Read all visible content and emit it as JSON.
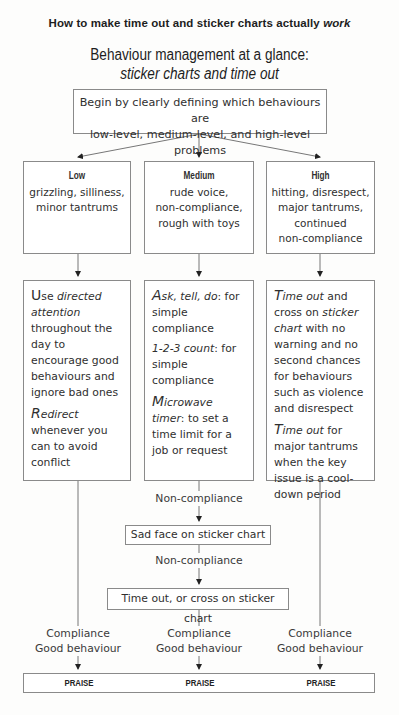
{
  "header": {
    "title": "How to make time out and sticker charts actually",
    "title_emph": "work"
  },
  "diagram": {
    "title_line1": "Behaviour management at a glance:",
    "title_line2": "sticker charts and time out",
    "start_box": {
      "line1": "Begin by clearly defining which behaviours are",
      "line2": "low-level, medium-level, and high-level problems"
    },
    "levels": [
      {
        "heading": "Low",
        "lines": [
          "grizzling, silliness,",
          "minor tantrums"
        ]
      },
      {
        "heading": "Medium",
        "lines": [
          "rude voice,",
          "non-compliance,",
          "rough with toys"
        ]
      },
      {
        "heading": "High",
        "lines": [
          "hitting, disrespect,",
          "major tantrums,",
          "continued",
          "non-compliance"
        ]
      }
    ],
    "strategies": {
      "low": {
        "p1_cap": "U",
        "p1_rest": "se ",
        "p1_em": "directed attention",
        "p1_tail": " throughout the day to encourage good behaviours and ignore bad ones",
        "p2_cap": "R",
        "p2_em": "edirect",
        "p2_tail": " whenever you can to avoid conflict"
      },
      "medium": {
        "p1_cap": "A",
        "p1_em": "sk, tell, do",
        "p1_tail": ": for simple compliance",
        "p2_em": "1-2-3 count",
        "p2_tail": ": for simple compliance",
        "p3_cap": "M",
        "p3_em": "icrowave timer",
        "p3_tail": ": to set a time limit for a job or request"
      },
      "high": {
        "p1_cap": "T",
        "p1_em": "ime out",
        "p1_mid": " and cross on ",
        "p1_em2": "sticker chart",
        "p1_tail": " with no warning and no second chances for behaviours such as violence and disrespect",
        "p2_cap": "T",
        "p2_em": "ime out",
        "p2_tail": " for major tantrums when the key issue is a cool-down period"
      }
    },
    "flow": {
      "noncompliance_1": "Non-compliance",
      "sad_face_box": "Sad face on sticker chart",
      "noncompliance_2": "Non-compliance",
      "timeout_box": "Time out, or cross on sticker chart",
      "compliance_labels": [
        {
          "line1": "Compliance",
          "line2": "Good behaviour"
        },
        {
          "line1": "Compliance",
          "line2": "Good behaviour"
        },
        {
          "line1": "Compliance",
          "line2": "Good behaviour"
        }
      ],
      "praise": [
        "PRAISE",
        "PRAISE",
        "PRAISE"
      ]
    }
  }
}
